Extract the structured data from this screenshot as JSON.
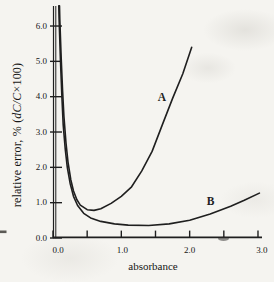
{
  "colors": {
    "ink": "#1f1f1f",
    "paper": "#f5f4f0",
    "text": "#161616"
  },
  "chart_data": {
    "type": "line",
    "title": "",
    "xlabel": "absorbance",
    "ylabel": "relative error, % (dC/C×100)",
    "ylabel_parts": {
      "prefix": "relative error, % (",
      "italic": "dC/C",
      "suffix": "×100)"
    },
    "xlim": [
      0.0,
      3.0
    ],
    "ylim": [
      0.0,
      6.5
    ],
    "grid": false,
    "legend": "inline curve letters",
    "x_ticks": {
      "major": [
        0,
        1,
        2,
        3
      ],
      "minor": [
        0.5,
        1.5,
        2.5
      ],
      "labels": [
        "0.0",
        "1.0",
        "2.0",
        "3.0"
      ]
    },
    "y_ticks": {
      "major": [
        0,
        1,
        2,
        3,
        4,
        5,
        6
      ],
      "labels": [
        "0.0",
        "1.0",
        "2.0",
        "3.0",
        "4.0",
        "5.0",
        "6.0"
      ]
    },
    "series": [
      {
        "name": "A",
        "label_pos": [
          1.595,
          4.0
        ],
        "points": [
          [
            0.095,
            6.57
          ],
          [
            0.1,
            6.2
          ],
          [
            0.12,
            5.09
          ],
          [
            0.14,
            4.16
          ],
          [
            0.16,
            3.45
          ],
          [
            0.19,
            2.69
          ],
          [
            0.22,
            2.15
          ],
          [
            0.26,
            1.65
          ],
          [
            0.3,
            1.33
          ],
          [
            0.35,
            1.08
          ],
          [
            0.4,
            0.93
          ],
          [
            0.5,
            0.8
          ],
          [
            0.6,
            0.78
          ],
          [
            0.7,
            0.83
          ],
          [
            0.85,
            0.98
          ],
          [
            1.0,
            1.18
          ],
          [
            1.15,
            1.45
          ],
          [
            1.3,
            1.9
          ],
          [
            1.45,
            2.45
          ],
          [
            1.6,
            3.2
          ],
          [
            1.75,
            3.95
          ],
          [
            1.9,
            4.65
          ],
          [
            2.03,
            5.4
          ]
        ]
      },
      {
        "name": "B",
        "label_pos": [
          2.305,
          1.04
        ],
        "points": [
          [
            0.085,
            6.57
          ],
          [
            0.09,
            6.2
          ],
          [
            0.11,
            5.0
          ],
          [
            0.13,
            4.0
          ],
          [
            0.15,
            3.2
          ],
          [
            0.18,
            2.5
          ],
          [
            0.21,
            2.0
          ],
          [
            0.25,
            1.55
          ],
          [
            0.3,
            1.18
          ],
          [
            0.36,
            0.92
          ],
          [
            0.45,
            0.7
          ],
          [
            0.55,
            0.57
          ],
          [
            0.7,
            0.47
          ],
          [
            0.9,
            0.4
          ],
          [
            1.1,
            0.365
          ],
          [
            1.4,
            0.355
          ],
          [
            1.7,
            0.4
          ],
          [
            2.0,
            0.5
          ],
          [
            2.3,
            0.68
          ],
          [
            2.6,
            0.9
          ],
          [
            2.8,
            1.07
          ],
          [
            3.02,
            1.27
          ]
        ]
      }
    ]
  }
}
